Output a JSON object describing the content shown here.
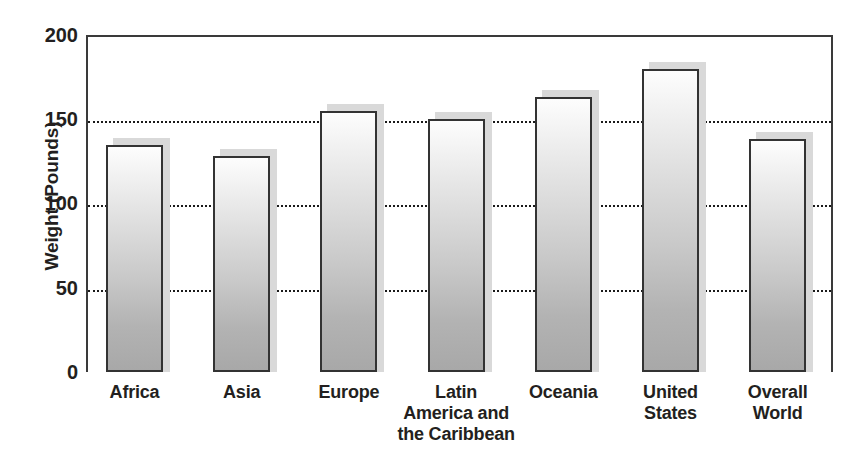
{
  "chart_data": {
    "type": "bar",
    "title": "",
    "xlabel": "",
    "ylabel": "Weight (Pounds)",
    "ylim": [
      0,
      200
    ],
    "yticks": [
      0,
      50,
      100,
      150,
      200
    ],
    "grid": "horizontal-dotted",
    "legend": "none",
    "categories": [
      "Africa",
      "Asia",
      "Europe",
      "Latin America and the Caribbean",
      "Oceania",
      "United States",
      "Overall World"
    ],
    "category_lines": [
      [
        "Africa"
      ],
      [
        "Asia"
      ],
      [
        "Europe"
      ],
      [
        "Latin",
        "America and",
        "the Caribbean"
      ],
      [
        "Oceania"
      ],
      [
        "United",
        "States"
      ],
      [
        "Overall",
        "World"
      ]
    ],
    "values": [
      135,
      128,
      155,
      150,
      163,
      180,
      138
    ],
    "colors": {
      "bar_top": "#fdfdfd",
      "bar_bottom": "#a8a8a8",
      "bar_border": "#333333",
      "bar_shadow": "#d9d9d9",
      "axis": "#3a3a3a",
      "grid": "#1a1a1a",
      "text": "#231f20",
      "background": "#ffffff"
    }
  }
}
